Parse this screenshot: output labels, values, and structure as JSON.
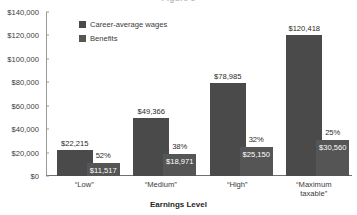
{
  "chart_data": {
    "type": "bar",
    "title": "Figure 3",
    "xlabel": "Earnings Level",
    "ylabel": "",
    "categories": [
      "“Low”",
      "“Medium”",
      "“High”",
      "“Maximum taxable”"
    ],
    "category_lines": [
      [
        "“Low”"
      ],
      [
        "“Medium”"
      ],
      [
        "“High”"
      ],
      [
        "“Maximum",
        "taxable”"
      ]
    ],
    "ylim": [
      0,
      140000
    ],
    "ytick_values": [
      0,
      20000,
      40000,
      60000,
      80000,
      100000,
      120000,
      140000
    ],
    "ytick_labels": [
      "$0",
      "$20,000",
      "$40,000",
      "$60,000",
      "$80,000",
      "$100,000",
      "$120,000",
      "$140,000"
    ],
    "grid": false,
    "legend_position": "top-center",
    "series": [
      {
        "name": "Career-average wages",
        "color": "#4a4a4a",
        "values": [
          22215,
          49366,
          78985,
          120418
        ],
        "labels": [
          "$22,215",
          "$49,366",
          "$78,985",
          "$120,418"
        ]
      },
      {
        "name": "Benefits",
        "color": "#555555",
        "values": [
          11517,
          18971,
          25150,
          30560
        ],
        "labels": [
          "$11,517",
          "$18,971",
          "$25,150",
          "$30,560"
        ]
      }
    ],
    "annotations": {
      "replacement_rates": [
        "52%",
        "38%",
        "32%",
        "25%"
      ]
    }
  }
}
